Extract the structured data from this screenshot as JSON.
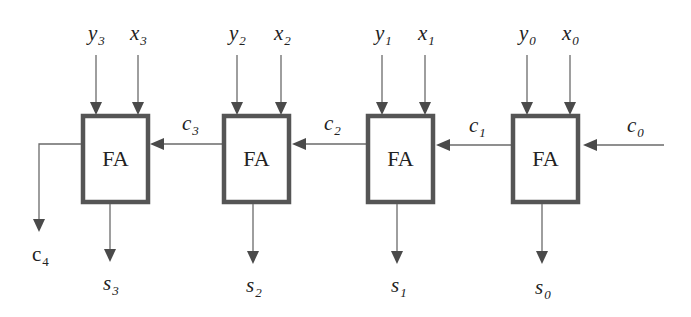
{
  "diagram": {
    "adders": [
      {
        "label": "FA",
        "x_in": {
          "base": "x",
          "sub": "3"
        },
        "y_in": {
          "base": "y",
          "sub": "3"
        },
        "sum": {
          "base": "s",
          "sub": "3"
        },
        "carry_in": {
          "base": "c",
          "sub": "3"
        }
      },
      {
        "label": "FA",
        "x_in": {
          "base": "x",
          "sub": "2"
        },
        "y_in": {
          "base": "y",
          "sub": "2"
        },
        "sum": {
          "base": "s",
          "sub": "2"
        },
        "carry_in": {
          "base": "c",
          "sub": "2"
        }
      },
      {
        "label": "FA",
        "x_in": {
          "base": "x",
          "sub": "1"
        },
        "y_in": {
          "base": "y",
          "sub": "1"
        },
        "sum": {
          "base": "s",
          "sub": "1"
        },
        "carry_in": {
          "base": "c",
          "sub": "1"
        }
      },
      {
        "label": "FA",
        "x_in": {
          "base": "x",
          "sub": "0"
        },
        "y_in": {
          "base": "y",
          "sub": "0"
        },
        "sum": {
          "base": "s",
          "sub": "0"
        },
        "carry_in": {
          "base": "c",
          "sub": "0"
        }
      }
    ],
    "carry_out": {
      "base": "c",
      "sub": "4"
    },
    "colors": {
      "wire": "#6a6a6a",
      "box_border": "#555555",
      "arrowhead": "#4a4a4a",
      "text": "#222222"
    }
  }
}
